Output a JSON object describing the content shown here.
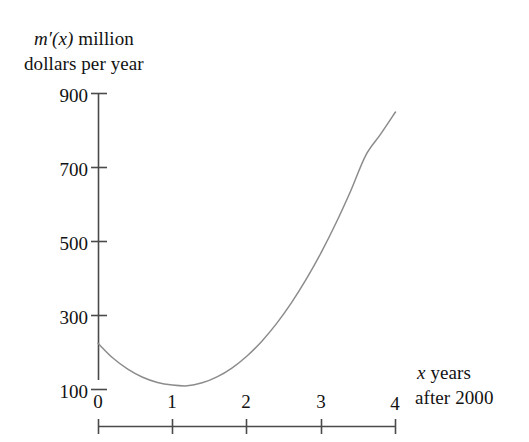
{
  "chart_data": {
    "type": "line",
    "title": "",
    "subtitle": "",
    "ylabel_line1_prefix": "m′(x)",
    "ylabel_line1_rest": " million",
    "ylabel_line2": "dollars per year",
    "xlabel_line1_prefix": "x",
    "xlabel_line1_rest": " years",
    "xlabel_line2": "after 2000",
    "xlabel": "x years after 2000",
    "ylabel": "m′(x) million dollars per year",
    "grid": false,
    "legend": "none",
    "xlim": [
      0,
      4
    ],
    "ylim": [
      0,
      900
    ],
    "xticks": [
      "0",
      "1",
      "2",
      "3",
      "4"
    ],
    "xtick_values": [
      0,
      1,
      2,
      3,
      4
    ],
    "yticks": [
      "100",
      "300",
      "500",
      "700",
      "900"
    ],
    "ytick_values": [
      100,
      300,
      500,
      700,
      900
    ],
    "series": [
      {
        "name": "m'(x)",
        "color": "#8c8c8c",
        "x": [
          0.0,
          0.2,
          0.4,
          0.6,
          0.8,
          1.0,
          1.2,
          1.4,
          1.6,
          1.8,
          2.0,
          2.2,
          2.4,
          2.6,
          2.8,
          3.0,
          3.2,
          3.4,
          3.6,
          3.8,
          4.0
        ],
        "y": [
          225,
          185,
          155,
          133,
          119,
          112,
          110,
          118,
          134,
          158,
          190,
          230,
          278,
          334,
          398,
          470,
          550,
          638,
          733,
          790,
          850
        ]
      }
    ],
    "annotations": []
  },
  "colors": {
    "axis": "#4a4a4a",
    "curve": "#8c8c8c",
    "text": "#121212",
    "background": "#ffffff"
  }
}
